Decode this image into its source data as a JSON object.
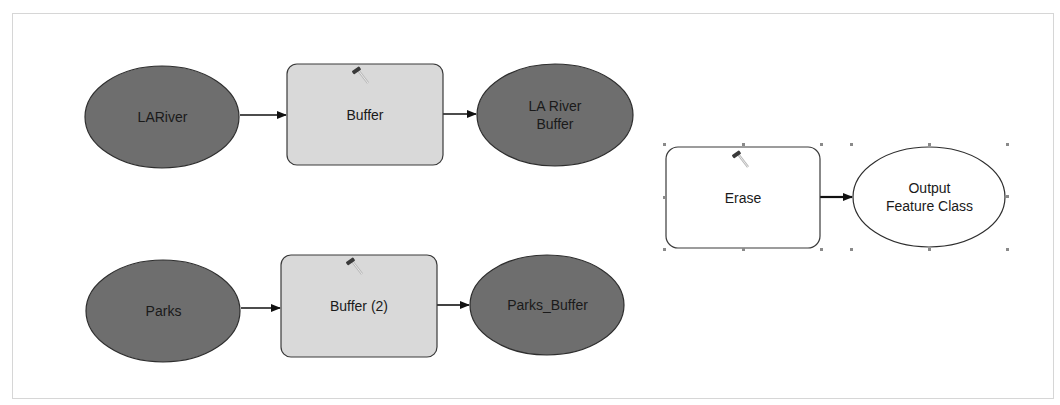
{
  "diagram": {
    "type": "ModelBuilder workflow",
    "colors": {
      "data_input_fill": "#6e6e6e",
      "tool_fill": "#d9d9d9",
      "output_fill": "#ffffff",
      "stroke": "#2a2a2a",
      "selection_handle": "#8a8a8a"
    },
    "nodes": [
      {
        "id": "lariver",
        "kind": "input-data",
        "shape": "ellipse",
        "label": "LARiver"
      },
      {
        "id": "buffer1",
        "kind": "tool",
        "shape": "rounded-rect",
        "label": "Buffer",
        "icon": "hammer-icon"
      },
      {
        "id": "lariver_buffer",
        "kind": "derived-data",
        "shape": "ellipse",
        "label": "LA River\nBuffer"
      },
      {
        "id": "parks",
        "kind": "input-data",
        "shape": "ellipse",
        "label": "Parks"
      },
      {
        "id": "buffer2",
        "kind": "tool",
        "shape": "rounded-rect",
        "label": "Buffer (2)",
        "icon": "hammer-icon"
      },
      {
        "id": "parks_buffer",
        "kind": "derived-data",
        "shape": "ellipse",
        "label": "Parks_Buffer"
      },
      {
        "id": "erase",
        "kind": "tool",
        "shape": "rounded-rect",
        "label": "Erase",
        "icon": "hammer-icon",
        "selected": true
      },
      {
        "id": "output",
        "kind": "output-data",
        "shape": "ellipse",
        "label": "Output\nFeature Class",
        "selected": true
      }
    ],
    "edges": [
      {
        "from": "lariver",
        "to": "buffer1"
      },
      {
        "from": "buffer1",
        "to": "lariver_buffer"
      },
      {
        "from": "parks",
        "to": "buffer2"
      },
      {
        "from": "buffer2",
        "to": "parks_buffer"
      },
      {
        "from": "erase",
        "to": "output"
      }
    ]
  }
}
